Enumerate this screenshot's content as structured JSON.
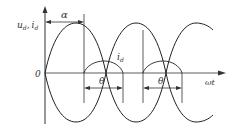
{
  "diagram": {
    "y_axis_label": "u",
    "y_axis_label_sub": "d",
    "y_axis_label_sep": ",",
    "y_axis_label2": "i",
    "y_axis_label2_sub": "d",
    "origin_label": "0",
    "x_axis_label": "ωt",
    "alpha_label": "α",
    "current_label": "i",
    "current_label_sub": "d",
    "theta_labels": [
      "θ",
      "θ"
    ]
  }
}
